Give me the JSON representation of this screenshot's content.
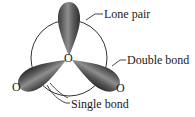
{
  "diagram": {
    "type": "orbital-diagram",
    "atoms": {
      "center": "O",
      "left": "O",
      "right": "O"
    },
    "labels": {
      "lone_pair": "Lone pair",
      "double_bond": "Double bond",
      "single_bond": "Single bond"
    },
    "colors": {
      "lobe_dark": "#3a3a3a",
      "lobe_light": "#9a9a9a",
      "line": "#333333"
    }
  }
}
